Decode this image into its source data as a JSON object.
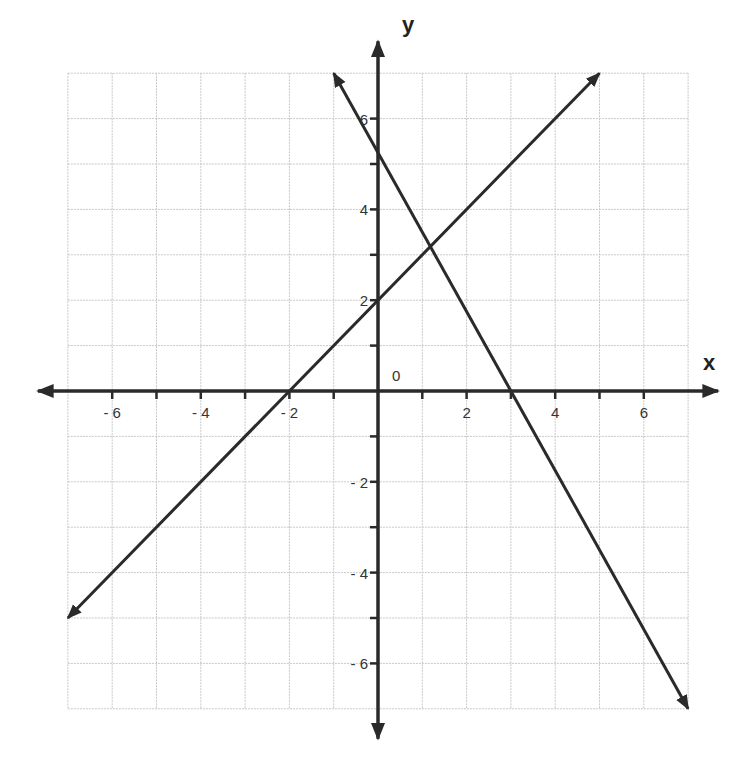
{
  "chart_data": {
    "type": "line",
    "title": "",
    "xlabel": "x",
    "ylabel": "y",
    "xlim": [
      -7,
      7
    ],
    "ylim": [
      -7,
      7
    ],
    "grid": true,
    "x_ticks": [
      -6,
      -4,
      -2,
      2,
      4,
      6
    ],
    "y_ticks": [
      -6,
      -4,
      -2,
      2,
      4,
      6
    ],
    "x_tick_labels": [
      "- 6",
      "- 4",
      "- 2",
      "2",
      "4",
      "6"
    ],
    "y_tick_labels": [
      "- 6",
      "- 4",
      "- 2",
      "2",
      "4",
      "6"
    ],
    "origin_label": "0",
    "series": [
      {
        "name": "line 1",
        "equation": "y = x + 2",
        "x": [
          -7,
          5
        ],
        "y": [
          -5,
          7
        ],
        "slope": 1,
        "y_intercept": 2,
        "x_intercept": -2
      },
      {
        "name": "line 2",
        "equation": "y = -1.75x + 5.25",
        "x": [
          -1,
          7
        ],
        "y": [
          7,
          -7
        ],
        "slope": -1.75,
        "y_intercept": 5.25,
        "x_intercept": 3
      }
    ],
    "intersection": [
      1.18,
      3.18
    ]
  },
  "labels": {
    "x_axis": "x",
    "y_axis": "y",
    "origin": "0"
  }
}
